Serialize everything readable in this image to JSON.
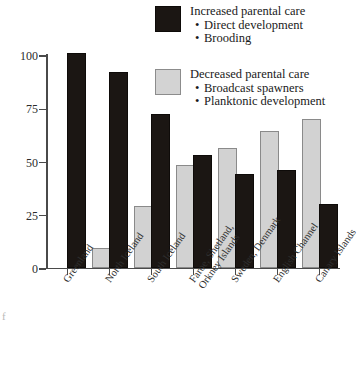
{
  "legend": {
    "increased": {
      "swatch": "dark-square-swatch",
      "title": "Increased parental care",
      "bullets": [
        "Direct development",
        "Brooding"
      ],
      "color": "#1b1613"
    },
    "decreased": {
      "swatch": "light-square-swatch",
      "title": "Decreased parental care",
      "bullets": [
        "Broadcast spawners",
        "Planktonic development"
      ],
      "color": "#d2d2d2"
    }
  },
  "axis": {
    "y_ticks": [
      "0",
      "25",
      "50",
      "75",
      "100"
    ],
    "y_tick_values": [
      0,
      25,
      50,
      75,
      100
    ]
  },
  "chart_data": {
    "type": "bar",
    "title": "",
    "xlabel": "",
    "ylabel": "",
    "ylim": [
      0,
      100
    ],
    "grid": false,
    "legend_position": "top-right",
    "categories": [
      "Greenland",
      "North Iceland",
      "South Iceland",
      "Faroe, Shetland,\nOrkney Islands",
      "Sweden, Denmark",
      "English Channel",
      "Canary Islands"
    ],
    "category_lines": [
      [
        "Greenland"
      ],
      [
        "North Iceland"
      ],
      [
        "South Iceland"
      ],
      [
        "Faroe, Shetland,",
        "Orkney Islands"
      ],
      [
        "Sweden, Denmark"
      ],
      [
        "English Channel"
      ],
      [
        "Canary Islands"
      ]
    ],
    "series": [
      {
        "name": "Decreased parental care",
        "color": "#d2d2d2",
        "values": [
          0,
          8,
          28,
          47,
          55,
          63,
          69
        ]
      },
      {
        "name": "Increased parental care",
        "color": "#1b1613",
        "values": [
          100,
          91,
          71,
          52,
          43,
          45,
          29
        ]
      }
    ]
  },
  "artifact": {
    "edge_fragment": "f"
  }
}
